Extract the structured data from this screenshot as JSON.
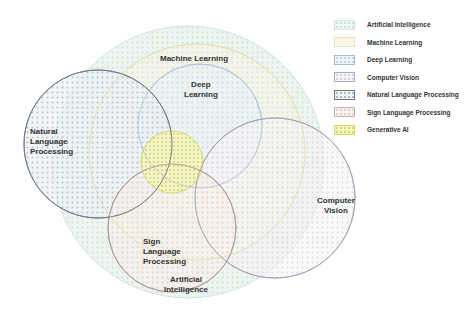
{
  "diagram": {
    "type": "venn",
    "sets": [
      {
        "id": "ai",
        "name": "Artificial Intelligence",
        "label_lines": [
          "Artificial",
          "Intelligence"
        ],
        "fill": "#dcebe4",
        "stroke": "#d3e6dc",
        "dot": "#c3dccf"
      },
      {
        "id": "ml",
        "name": "Machine Learning",
        "label_lines": [
          "Machine Learning"
        ],
        "fill": "#f3f1dc",
        "stroke": "#e6e2b8",
        "dot": "#e8e4c0"
      },
      {
        "id": "dl",
        "name": "Deep Learning",
        "label_lines": [
          "Deep",
          "Learning"
        ],
        "fill": "#e6eff6",
        "stroke": "#a8b8cc",
        "dot": "#cddbe8"
      },
      {
        "id": "cv",
        "name": "Computer Vision",
        "label_lines": [
          "Computer",
          "Vision"
        ],
        "fill": "#f1eff3",
        "stroke": "#a89fb0",
        "dot": "#d8d4dc"
      },
      {
        "id": "nlp",
        "name": "Natural Language Processing",
        "label_lines": [
          "Natural",
          "Language",
          "Processing"
        ],
        "fill": "#e8edf2",
        "stroke": "#6d7680",
        "dot": "#b8c2cc"
      },
      {
        "id": "slp",
        "name": "Sign Language Processing",
        "label_lines": [
          "Sign",
          "Language",
          "Processing"
        ],
        "fill": "#f5ebe8",
        "stroke": "#b09a98",
        "dot": "#e2cfca"
      },
      {
        "id": "genai",
        "name": "Generative AI",
        "label_lines": [],
        "fill": "#f0f0b0",
        "stroke": "#d8d86a",
        "dot": "#d9da5a"
      }
    ]
  },
  "labels": {
    "machine_learning": "Machine Learning",
    "deep_learning_1": "Deep",
    "deep_learning_2": "Learning",
    "nlp_1": "Natural",
    "nlp_2": "Language",
    "nlp_3": "Processing",
    "cv_1": "Computer",
    "cv_2": "Vision",
    "slp_1": "Sign",
    "slp_2": "Language",
    "slp_3": "Processing",
    "ai_1": "Artificial",
    "ai_2": "Intelligence"
  },
  "legend": {
    "items": [
      {
        "label": "Artificial Intelligence"
      },
      {
        "label": "Machine Learning"
      },
      {
        "label": "Deep Learning"
      },
      {
        "label": "Computer Vision"
      },
      {
        "label": "Natural Language Processing"
      },
      {
        "label": "Sign Language Processing"
      },
      {
        "label": "Generative AI"
      }
    ]
  }
}
